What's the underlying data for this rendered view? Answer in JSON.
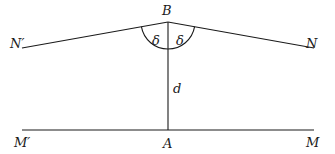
{
  "diagram": {
    "points": {
      "B": {
        "label": "B",
        "x": 168,
        "y": 22
      },
      "A": {
        "label": "A",
        "x": 168,
        "y": 130
      },
      "N_prime": {
        "label": "N′",
        "x": 22,
        "y": 48
      },
      "N": {
        "label": "N",
        "x": 314,
        "y": 48
      },
      "M_prime": {
        "label": "M′",
        "x": 22,
        "y": 130
      },
      "M": {
        "label": "M",
        "x": 314,
        "y": 130
      }
    },
    "angle_labels": {
      "left": "δ",
      "right": "δ"
    },
    "distance_label": "d",
    "colors": {
      "stroke": "#1a1a1a",
      "background": "#ffffff"
    }
  }
}
